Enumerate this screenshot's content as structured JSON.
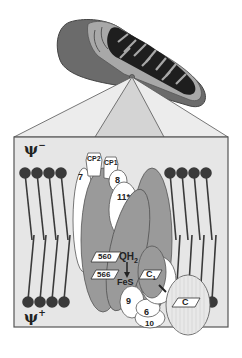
{
  "diagram": {
    "membrane": {
      "top_potential": "ψ",
      "top_sign": "−",
      "bottom_potential": "ψ",
      "bottom_sign": "+"
    },
    "subunits": {
      "core_protein_2": "CP2",
      "core_protein_1": "CP1",
      "subunit_7": "7",
      "subunit_8": "8",
      "subunit_11": "11*",
      "subunit_9": "9",
      "subunit_6": "6",
      "subunit_10": "10"
    },
    "cofactors": {
      "heme_b560": "560",
      "heme_b566": "566",
      "ubiquinol": "QH",
      "ubiquinol_sub": "2",
      "iron_sulfur": "FeS",
      "cytochrome_c1": "C",
      "cytochrome_c1_sub": "1",
      "cytochrome_c": "C"
    },
    "colors": {
      "mito_outer": "#6b6b6b",
      "mito_inner": "#a8a8a8",
      "cristae": "#1e1e1e",
      "box_fill": "#e6e6e6",
      "zoom_side": "#ececec",
      "zoom_center": "#d4d4d4",
      "protein_gray": "#9a9a9a",
      "protein_white": "#ffffff",
      "lipid_head": "#3a3a3a"
    }
  }
}
